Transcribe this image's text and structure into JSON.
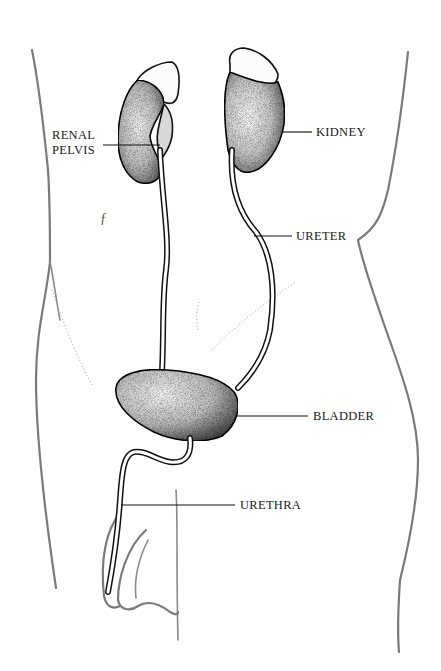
{
  "figure": {
    "colors": {
      "background": "#ffffff",
      "ink": "#111111",
      "body_outline": "#7a7a7a",
      "stipple": "#222222"
    }
  },
  "labels": {
    "renal_pelvis_line1": "RENAL",
    "renal_pelvis_line2": "PELVIS",
    "kidney": "KIDNEY",
    "ureter": "URETER",
    "bladder": "BLADDER",
    "urethra": "URETHRA"
  },
  "marks": {
    "stray_glyph": "ƒ"
  }
}
